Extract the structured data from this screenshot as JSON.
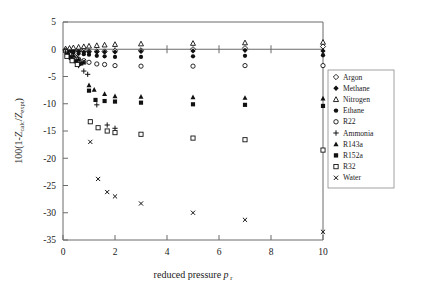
{
  "chart_data": {
    "type": "scatter",
    "title": "",
    "xlabel": "reduced pressure p r",
    "xlabel_main": "reduced pressure",
    "xlabel_symbol": "p",
    "xlabel_subscript": "r",
    "ylabel": "100(1-Z calc/Z expt)",
    "ylabel_prefix": "100(1-",
    "ylabel_z1": "Z",
    "ylabel_sub1": "calc",
    "ylabel_slash": "/",
    "ylabel_z2": "Z",
    "ylabel_sub2": "expt",
    "ylabel_suffix": ")",
    "xlim": [
      0,
      10
    ],
    "ylim": [
      -35,
      5
    ],
    "xticks": [
      0,
      2,
      4,
      6,
      8,
      10
    ],
    "xtick_labels": [
      "0",
      "2",
      "4",
      "6",
      "8",
      "10"
    ],
    "yticks": [
      5,
      0,
      -5,
      -10,
      -15,
      -20,
      -25,
      -30,
      -35
    ],
    "ytick_labels": [
      "5",
      "0",
      "-5",
      "-10",
      "-15",
      "-20",
      "-25",
      "-30",
      "-35"
    ],
    "grid": false,
    "zero_reference_line": 0,
    "legend_position": "right-middle",
    "series": [
      {
        "name": "Argon",
        "marker": "open-diamond",
        "points": [
          {
            "x": 0.1,
            "y": -0.1
          },
          {
            "x": 0.25,
            "y": -0.2
          },
          {
            "x": 0.4,
            "y": -0.2
          },
          {
            "x": 0.6,
            "y": -0.3
          },
          {
            "x": 0.8,
            "y": -0.3
          },
          {
            "x": 1.0,
            "y": -0.4
          },
          {
            "x": 1.3,
            "y": -0.4
          },
          {
            "x": 1.6,
            "y": -0.4
          },
          {
            "x": 2.0,
            "y": -0.3
          },
          {
            "x": 3.0,
            "y": -0.2
          },
          {
            "x": 5.0,
            "y": 0.0
          },
          {
            "x": 7.0,
            "y": 0.2
          },
          {
            "x": 10.0,
            "y": 0.5
          }
        ]
      },
      {
        "name": "Methane",
        "marker": "filled-diamond",
        "points": [
          {
            "x": 0.1,
            "y": -0.1
          },
          {
            "x": 0.25,
            "y": -0.2
          },
          {
            "x": 0.4,
            "y": -0.3
          },
          {
            "x": 0.6,
            "y": -0.4
          },
          {
            "x": 0.8,
            "y": -0.5
          },
          {
            "x": 1.0,
            "y": -0.5
          },
          {
            "x": 1.3,
            "y": -0.5
          },
          {
            "x": 1.6,
            "y": -0.5
          },
          {
            "x": 2.0,
            "y": -0.5
          },
          {
            "x": 3.0,
            "y": -0.4
          },
          {
            "x": 5.0,
            "y": -0.3
          },
          {
            "x": 7.0,
            "y": -0.2
          },
          {
            "x": 10.0,
            "y": -0.3
          }
        ]
      },
      {
        "name": "Nitrogen",
        "marker": "open-triangle",
        "points": [
          {
            "x": 0.1,
            "y": 0.1
          },
          {
            "x": 0.25,
            "y": 0.2
          },
          {
            "x": 0.4,
            "y": 0.3
          },
          {
            "x": 0.6,
            "y": 0.4
          },
          {
            "x": 0.8,
            "y": 0.5
          },
          {
            "x": 1.0,
            "y": 0.6
          },
          {
            "x": 1.3,
            "y": 0.7
          },
          {
            "x": 1.6,
            "y": 0.8
          },
          {
            "x": 2.0,
            "y": 0.9
          },
          {
            "x": 3.0,
            "y": 1.0
          },
          {
            "x": 5.0,
            "y": 1.1
          },
          {
            "x": 7.0,
            "y": 1.2
          },
          {
            "x": 10.0,
            "y": 1.3
          }
        ]
      },
      {
        "name": "Ethane",
        "marker": "filled-circle",
        "points": [
          {
            "x": 0.1,
            "y": -0.2
          },
          {
            "x": 0.25,
            "y": -0.4
          },
          {
            "x": 0.4,
            "y": -0.6
          },
          {
            "x": 0.6,
            "y": -0.8
          },
          {
            "x": 0.8,
            "y": -0.9
          },
          {
            "x": 1.0,
            "y": -1.0
          },
          {
            "x": 1.3,
            "y": -1.2
          },
          {
            "x": 1.6,
            "y": -1.3
          },
          {
            "x": 2.0,
            "y": -1.4
          },
          {
            "x": 3.0,
            "y": -1.4
          },
          {
            "x": 5.0,
            "y": -1.3
          },
          {
            "x": 7.0,
            "y": -1.2
          },
          {
            "x": 10.0,
            "y": -1.1
          }
        ]
      },
      {
        "name": "R22",
        "marker": "open-circle",
        "points": [
          {
            "x": 0.1,
            "y": -0.4
          },
          {
            "x": 0.25,
            "y": -0.9
          },
          {
            "x": 0.4,
            "y": -1.4
          },
          {
            "x": 0.6,
            "y": -1.8
          },
          {
            "x": 0.8,
            "y": -2.1
          },
          {
            "x": 1.0,
            "y": -2.4
          },
          {
            "x": 1.3,
            "y": -2.7
          },
          {
            "x": 1.6,
            "y": -2.8
          },
          {
            "x": 2.0,
            "y": -3.0
          },
          {
            "x": 3.0,
            "y": -3.1
          },
          {
            "x": 5.0,
            "y": -3.1
          },
          {
            "x": 7.0,
            "y": -3.0
          },
          {
            "x": 10.0,
            "y": -3.0
          }
        ]
      },
      {
        "name": "Ammonia",
        "marker": "plus",
        "points": [
          {
            "x": 0.1,
            "y": -0.5
          },
          {
            "x": 0.25,
            "y": -1.2
          },
          {
            "x": 0.4,
            "y": -2.0
          },
          {
            "x": 0.6,
            "y": -3.0
          },
          {
            "x": 0.8,
            "y": -4.0
          },
          {
            "x": 0.95,
            "y": -4.6
          },
          {
            "x": 1.3,
            "y": -10.2
          },
          {
            "x": 1.7,
            "y": -13.9
          },
          {
            "x": 2.0,
            "y": -14.5
          }
        ]
      },
      {
        "name": "R143a",
        "marker": "filled-triangle",
        "points": [
          {
            "x": 0.2,
            "y": -0.6
          },
          {
            "x": 0.4,
            "y": -1.2
          },
          {
            "x": 0.6,
            "y": -1.8
          },
          {
            "x": 0.8,
            "y": -2.4
          },
          {
            "x": 1.0,
            "y": -6.6
          },
          {
            "x": 1.2,
            "y": -7.4
          },
          {
            "x": 1.6,
            "y": -8.2
          },
          {
            "x": 2.0,
            "y": -8.6
          },
          {
            "x": 3.0,
            "y": -8.7
          },
          {
            "x": 5.0,
            "y": -8.8
          },
          {
            "x": 7.0,
            "y": -8.9
          },
          {
            "x": 10.0,
            "y": -9.0
          }
        ]
      },
      {
        "name": "R152a",
        "marker": "filled-square",
        "points": [
          {
            "x": 0.15,
            "y": -1.0
          },
          {
            "x": 0.3,
            "y": -1.6
          },
          {
            "x": 0.5,
            "y": -2.2
          },
          {
            "x": 0.7,
            "y": -2.6
          },
          {
            "x": 1.0,
            "y": -7.6
          },
          {
            "x": 1.25,
            "y": -9.3
          },
          {
            "x": 1.6,
            "y": -9.5
          },
          {
            "x": 2.0,
            "y": -9.6
          },
          {
            "x": 3.0,
            "y": -9.8
          },
          {
            "x": 5.0,
            "y": -10.1
          },
          {
            "x": 7.0,
            "y": -10.2
          },
          {
            "x": 10.0,
            "y": -10.4
          }
        ]
      },
      {
        "name": "R32",
        "marker": "open-square",
        "points": [
          {
            "x": 0.15,
            "y": -1.3
          },
          {
            "x": 0.35,
            "y": -2.1
          },
          {
            "x": 0.55,
            "y": -2.8
          },
          {
            "x": 1.05,
            "y": -13.3
          },
          {
            "x": 1.35,
            "y": -14.4
          },
          {
            "x": 1.7,
            "y": -15.0
          },
          {
            "x": 2.0,
            "y": -15.3
          },
          {
            "x": 3.0,
            "y": -15.6
          },
          {
            "x": 5.0,
            "y": -16.3
          },
          {
            "x": 7.0,
            "y": -16.6
          },
          {
            "x": 10.0,
            "y": -18.5
          }
        ]
      },
      {
        "name": "Water",
        "marker": "cross",
        "points": [
          {
            "x": 0.3,
            "y": -0.5
          },
          {
            "x": 0.55,
            "y": -1.3
          },
          {
            "x": 0.8,
            "y": -2.2
          },
          {
            "x": 1.05,
            "y": -17.0
          },
          {
            "x": 1.35,
            "y": -23.8
          },
          {
            "x": 1.7,
            "y": -26.2
          },
          {
            "x": 2.0,
            "y": -27.0
          },
          {
            "x": 3.0,
            "y": -28.3
          },
          {
            "x": 5.0,
            "y": -30.0
          },
          {
            "x": 7.0,
            "y": -31.3
          },
          {
            "x": 10.0,
            "y": -33.5
          }
        ]
      }
    ],
    "legend_entries": [
      {
        "label": "Argon",
        "marker": "open-diamond"
      },
      {
        "label": "Methane",
        "marker": "filled-diamond"
      },
      {
        "label": "Nitrogen",
        "marker": "open-triangle"
      },
      {
        "label": "Ethane",
        "marker": "filled-circle"
      },
      {
        "label": "R22",
        "marker": "open-circle"
      },
      {
        "label": "Ammonia",
        "marker": "plus"
      },
      {
        "label": "R143a",
        "marker": "filled-triangle"
      },
      {
        "label": "R152a",
        "marker": "filled-square"
      },
      {
        "label": "R32",
        "marker": "open-square"
      },
      {
        "label": "Water",
        "marker": "cross"
      }
    ]
  }
}
